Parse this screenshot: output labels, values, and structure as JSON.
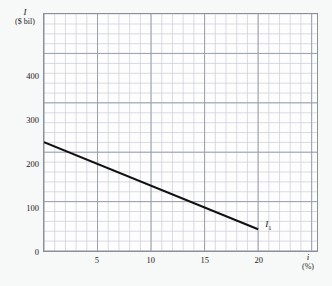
{
  "figure": {
    "background_color": "#f7f8f8",
    "plot_background_color": "#fdfdfd",
    "border_color": "#8b8f97",
    "grid_minor_color": "#c9cdd6",
    "grid_major_color": "#9aa0ab",
    "line_color": "#111111"
  },
  "labels": {
    "y_symbol": "I",
    "y_unit": "($ bil)",
    "x_symbol": "i",
    "x_unit": "(%)",
    "curve_symbol": "I",
    "curve_subscript": "1"
  },
  "chart_data": {
    "type": "line",
    "title": "",
    "xlabel": "i (%)",
    "ylabel": "I ($ bil)",
    "xlim": [
      0,
      25.5
    ],
    "ylim": [
      0,
      545
    ],
    "grid": true,
    "grid_minor_x_step": 1,
    "grid_minor_y_step": 22.7,
    "grid_major_x_step": 5,
    "grid_major_y_step": 113.6,
    "legend": "none",
    "xticks": [
      5,
      10,
      15,
      20
    ],
    "xtick_labels": [
      "5",
      "10",
      "15",
      "20"
    ],
    "yticks": [
      0,
      100,
      200,
      300,
      400
    ],
    "ytick_labels": [
      "0",
      "100",
      "200",
      "300",
      "400"
    ],
    "series": [
      {
        "name": "I1",
        "label": "I₁",
        "x": [
          0,
          20
        ],
        "y": [
          250,
          50
        ],
        "slope_per_percent": -10,
        "intercept": 250,
        "color": "#111111",
        "linewidth": 2
      }
    ],
    "annotations": [
      {
        "text": "I₁",
        "x": 20.6,
        "y": 62,
        "anchor": "left"
      }
    ]
  }
}
